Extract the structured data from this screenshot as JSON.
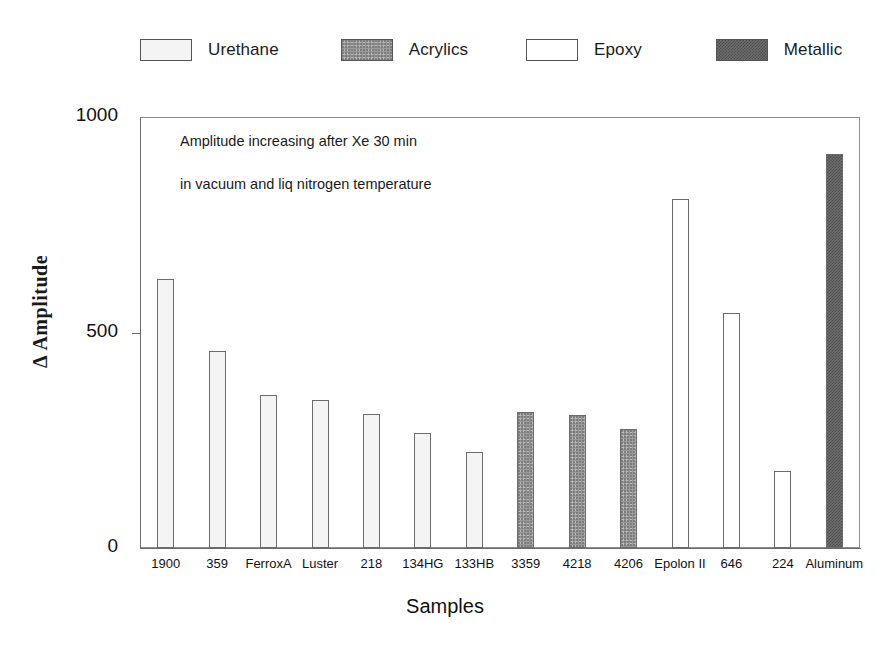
{
  "chart_data": {
    "type": "bar",
    "title": "",
    "xlabel": "Samples",
    "ylabel": "Δ Amplitude",
    "ylim": [
      0,
      1000
    ],
    "yticks": [
      0,
      500,
      1000
    ],
    "ytick_labels": [
      "0",
      "500",
      "1000"
    ],
    "grid": false,
    "legend_position": "top",
    "annotations": [
      "Amplitude increasing after Xe 30 min",
      "in vacuum and liq nitrogen temperature"
    ],
    "legend": [
      {
        "label": "Urethane",
        "swatch": "urethane"
      },
      {
        "label": "Acrylics",
        "swatch": "acrylics"
      },
      {
        "label": "Epoxy",
        "swatch": "epoxy"
      },
      {
        "label": "Metallic",
        "swatch": "metallic"
      }
    ],
    "categories": [
      "1900",
      "359",
      "FerroxA",
      "Luster",
      "218",
      "134HG",
      "133HB",
      "3359",
      "4218",
      "4206",
      "Epolon II",
      "646",
      "224",
      "Aluminum"
    ],
    "values": [
      625,
      458,
      354,
      343,
      312,
      268,
      222,
      315,
      308,
      275,
      810,
      545,
      178,
      915
    ],
    "groups": [
      "Urethane",
      "Urethane",
      "Urethane",
      "Urethane",
      "Urethane",
      "Urethane",
      "Urethane",
      "Acrylics",
      "Acrylics",
      "Acrylics",
      "Epoxy",
      "Epoxy",
      "Epoxy",
      "Metallic"
    ],
    "bars": [
      {
        "category": "1900",
        "value": 625,
        "group": "Urethane"
      },
      {
        "category": "359",
        "value": 458,
        "group": "Urethane"
      },
      {
        "category": "FerroxA",
        "value": 354,
        "group": "Urethane"
      },
      {
        "category": "Luster",
        "value": 343,
        "group": "Urethane"
      },
      {
        "category": "218",
        "value": 312,
        "group": "Urethane"
      },
      {
        "category": "134HG",
        "value": 268,
        "group": "Urethane"
      },
      {
        "category": "133HB",
        "value": 222,
        "group": "Urethane"
      },
      {
        "category": "3359",
        "value": 315,
        "group": "Acrylics"
      },
      {
        "category": "4218",
        "value": 308,
        "group": "Acrylics"
      },
      {
        "category": "4206",
        "value": 275,
        "group": "Acrylics"
      },
      {
        "category": "Epolon II",
        "value": 810,
        "group": "Epoxy"
      },
      {
        "category": "646",
        "value": 545,
        "group": "Epoxy"
      },
      {
        "category": "224",
        "value": 178,
        "group": "Epoxy"
      },
      {
        "category": "Aluminum",
        "value": 915,
        "group": "Metallic"
      }
    ]
  },
  "colors": {
    "axis": "#6b6b6b",
    "frame": "#8d8d8d",
    "text": "#111111",
    "urethane": "#f4f4f4",
    "acrylics": "#9a9a9a",
    "epoxy": "#ffffff",
    "metallic": "#6f6f6f",
    "background": "#ffffff"
  }
}
